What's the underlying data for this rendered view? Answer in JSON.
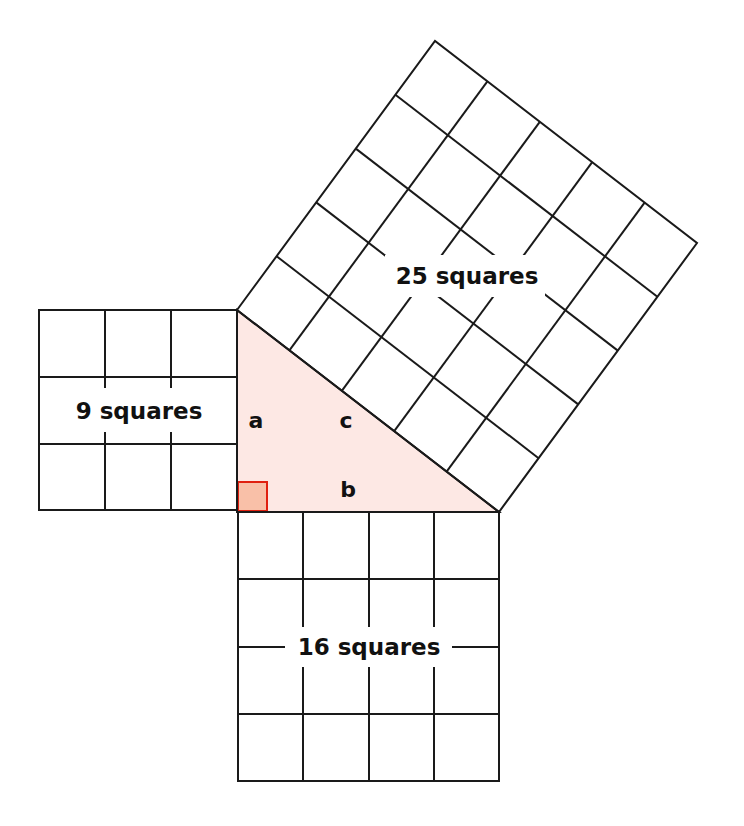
{
  "diagram": {
    "colors": {
      "line": "#1a1a1a",
      "triangle_fill": "#fde8e4",
      "right_angle_fill": "#f9c0a8",
      "right_angle_stroke": "#e02010",
      "background": "#ffffff"
    },
    "squares": {
      "small": {
        "label": "9 squares",
        "grid": 3
      },
      "medium": {
        "label": "16 squares",
        "grid": 4
      },
      "large": {
        "label": "25 squares",
        "grid": 5
      }
    },
    "sides": {
      "a": "a",
      "b": "b",
      "c": "c"
    }
  }
}
